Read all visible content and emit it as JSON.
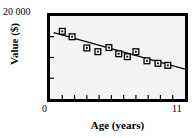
{
  "chart_data": {
    "type": "scatter",
    "title": "",
    "xlabel": "Age (years)",
    "ylabel": "Value ($)",
    "xlim": [
      0,
      11
    ],
    "ylim": [
      0,
      20000
    ],
    "x_tick_labels": [
      "0",
      "11"
    ],
    "y_tick_labels": [
      "20 000"
    ],
    "grid": false,
    "legend": null,
    "marker_style": "open-square-with-center-dot",
    "line_color": "#000000",
    "marker_edge_color": "#000000",
    "marker_face_color": "#f4f4f4",
    "plot_background": "#f4f4f4",
    "frame_color": "#000000",
    "x_minor_ticks": [
      1,
      2,
      3,
      4,
      5,
      6,
      7,
      8,
      9,
      10
    ],
    "y_minor_ticks": [
      5000,
      10000,
      15000
    ],
    "points": [
      {
        "x": 1.0,
        "y": 16300
      },
      {
        "x": 1.8,
        "y": 15000
      },
      {
        "x": 3.0,
        "y": 12300
      },
      {
        "x": 3.9,
        "y": 11400
      },
      {
        "x": 4.8,
        "y": 12400
      },
      {
        "x": 5.6,
        "y": 10900
      },
      {
        "x": 6.3,
        "y": 10200
      },
      {
        "x": 7.0,
        "y": 11400
      },
      {
        "x": 7.9,
        "y": 9200
      },
      {
        "x": 8.8,
        "y": 8600
      },
      {
        "x": 9.6,
        "y": 8100
      }
    ],
    "trend_line": {
      "type": "linear-regression",
      "x_start": 0.3,
      "y_start": 16000,
      "x_end": 11.0,
      "y_end": 7200
    }
  },
  "axes": {
    "y_top_tick": "20 000",
    "y_title": "Value ($)",
    "x_min_tick": "0",
    "x_max_tick": "11",
    "x_title": "Age (years)"
  }
}
